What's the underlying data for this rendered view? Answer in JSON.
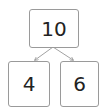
{
  "diagram": {
    "type": "number-bond",
    "whole": "10",
    "parts": [
      "4",
      "6"
    ],
    "line_color": "#8a8a8a",
    "border_color": "#9a9a9a"
  }
}
